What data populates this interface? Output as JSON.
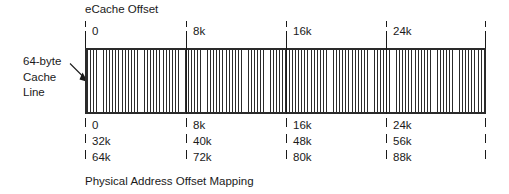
{
  "figure": {
    "title": "eCache Offset",
    "caption": "Physical Address Offset Mapping",
    "side_label_lines": [
      "64-byte",
      "Cache",
      "Line"
    ],
    "side_label": "64-byte Cache Line",
    "arrow": "arrow pointing from the 64-byte Cache Line label to the first hatched cache line at the left edge of the cache bar",
    "colors": {
      "ink": "#1a1a1a",
      "hatch": "#2b2b2b",
      "background": "#ffffff"
    }
  },
  "ecache_offset_axis": {
    "label": "eCache Offset",
    "ticks": [
      "0",
      "8k",
      "16k",
      "24k",
      ""
    ]
  },
  "physical_address_offset_mapping": {
    "label": "Physical Address Offset Mapping",
    "rows": [
      [
        "0",
        "8k",
        "16k",
        "24k"
      ],
      [
        "32k",
        "40k",
        "48k",
        "56k"
      ],
      [
        "64k",
        "72k",
        "80k",
        "88k"
      ]
    ]
  },
  "cache_bar": {
    "description": "hatched bar of 64-byte cache lines spanning 0 to 32k of eCache offset",
    "segments": 4
  }
}
